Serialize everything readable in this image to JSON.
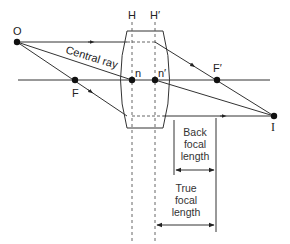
{
  "diagram": {
    "labels": {
      "object": "O",
      "image": "I",
      "front_focus": "F",
      "back_focus": "F′",
      "front_principal_plane": "H",
      "back_principal_plane": "H′",
      "front_nodal_point": "n",
      "back_nodal_point": "n′",
      "central_ray": "Central ray",
      "back_focal_length": [
        "Back",
        "focal",
        "length"
      ],
      "true_focal_length": [
        "True",
        "focal",
        "length"
      ]
    },
    "colors": {
      "line": "#333333",
      "background": "#ffffff"
    }
  }
}
